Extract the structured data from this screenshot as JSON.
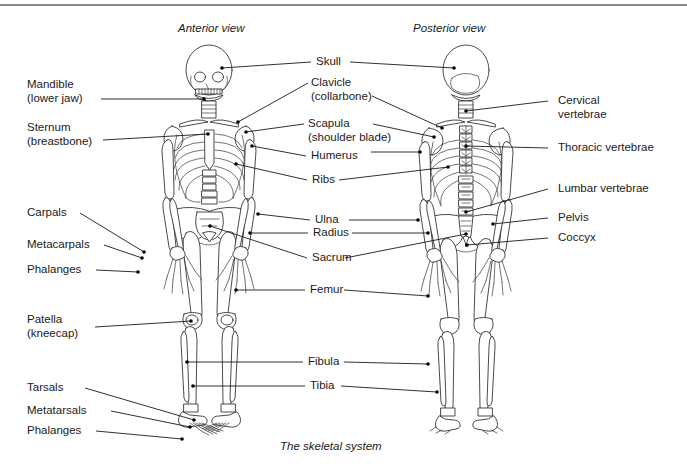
{
  "figure": {
    "caption": "The skeletal system",
    "views": [
      {
        "id": "anterior",
        "title": "Anterior view"
      },
      {
        "id": "posterior",
        "title": "Posterior view"
      }
    ]
  },
  "labels": {
    "left": [
      {
        "id": "mandible",
        "line1": "Mandible",
        "line2": "(lower jaw)"
      },
      {
        "id": "sternum",
        "line1": "Sternum",
        "line2": "(breastbone)"
      },
      {
        "id": "carpals",
        "line1": "Carpals",
        "line2": ""
      },
      {
        "id": "metacarpals",
        "line1": "Metacarpals",
        "line2": ""
      },
      {
        "id": "phalanges-hand",
        "line1": "Phalanges",
        "line2": ""
      },
      {
        "id": "patella",
        "line1": "Patella",
        "line2": "(kneecap)"
      },
      {
        "id": "tarsals",
        "line1": "Tarsals",
        "line2": ""
      },
      {
        "id": "metatarsals",
        "line1": "Metatarsals",
        "line2": ""
      },
      {
        "id": "phalanges-foot",
        "line1": "Phalanges",
        "line2": ""
      }
    ],
    "center": [
      {
        "id": "skull",
        "line1": "Skull",
        "line2": ""
      },
      {
        "id": "clavicle",
        "line1": "Clavicle",
        "line2": "(collarbone)"
      },
      {
        "id": "scapula",
        "line1": "Scapula",
        "line2": "(shoulder blade)"
      },
      {
        "id": "humerus",
        "line1": "Humerus",
        "line2": ""
      },
      {
        "id": "ribs",
        "line1": "Ribs",
        "line2": ""
      },
      {
        "id": "ulna",
        "line1": "Ulna",
        "line2": ""
      },
      {
        "id": "radius",
        "line1": "Radius",
        "line2": ""
      },
      {
        "id": "sacrum",
        "line1": "Sacrum",
        "line2": ""
      },
      {
        "id": "femur",
        "line1": "Femur",
        "line2": ""
      },
      {
        "id": "fibula",
        "line1": "Fibula",
        "line2": ""
      },
      {
        "id": "tibia",
        "line1": "Tibia",
        "line2": ""
      }
    ],
    "right": [
      {
        "id": "cervical-vertebrae",
        "line1": "Cervical",
        "line2": "vertebrae"
      },
      {
        "id": "thoracic-vertebrae",
        "line1": "Thoracic vertebrae",
        "line2": ""
      },
      {
        "id": "lumbar-vertebrae",
        "line1": "Lumbar vertebrae",
        "line2": ""
      },
      {
        "id": "pelvis",
        "line1": "Pelvis",
        "line2": ""
      },
      {
        "id": "coccyx",
        "line1": "Coccyx",
        "line2": ""
      }
    ]
  },
  "colors": {
    "ink": "#1a1a1a",
    "bone_stroke": "#2a2a2a",
    "rule": "#8a8a8a",
    "background": "#ffffff"
  }
}
